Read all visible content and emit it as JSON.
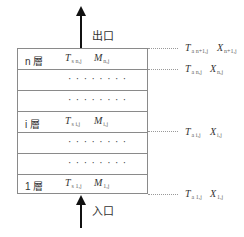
{
  "diagram": {
    "outlet_label": "出口",
    "inlet_label": "入口",
    "layers": [
      {
        "kind": "layer",
        "label": "n 層",
        "ts": "T",
        "ts_sub": "s n,j",
        "m": "M",
        "m_sub": "n,j"
      },
      {
        "kind": "dots",
        "text": "········"
      },
      {
        "kind": "dots",
        "text": "········"
      },
      {
        "kind": "layer",
        "label": "i 層",
        "ts": "T",
        "ts_sub": "s i,j",
        "m": "M",
        "m_sub": "i,j"
      },
      {
        "kind": "dots",
        "text": "········"
      },
      {
        "kind": "dots",
        "text": "········"
      },
      {
        "kind": "layer",
        "label": "1 層",
        "ts": "T",
        "ts_sub": "s 1,j",
        "m": "M",
        "m_sub": "1,j"
      }
    ],
    "right_labels": [
      {
        "ta": "T",
        "ta_sub": "a n+1,j",
        "x": "X",
        "x_sub": "n+1,j"
      },
      {
        "ta": "T",
        "ta_sub": "a n,j",
        "x": "X",
        "x_sub": "n,j"
      },
      {
        "ta": "T",
        "ta_sub": "a i,j",
        "x": "X",
        "x_sub": "i,j"
      },
      {
        "ta": "T",
        "ta_sub": "a 1,j",
        "x": "X",
        "x_sub": "1,j"
      }
    ]
  }
}
